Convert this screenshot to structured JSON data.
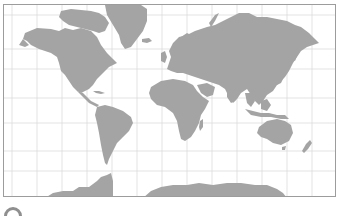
{
  "map": {
    "title": "",
    "projection": "world-cylindrical",
    "colors": {
      "land": "#a4a4a4",
      "ocean": "#ffffff",
      "gridline": "#dcdcdc",
      "border": "#9c9c9c",
      "corner_icon": "#8f8f8f"
    },
    "grid": {
      "meridians_x": [
        11,
        36,
        61,
        86,
        111,
        136,
        161,
        186,
        211,
        236,
        261,
        286,
        311
      ],
      "parallels_y": [
        14,
        48,
        68,
        97,
        122,
        150,
        170
      ]
    },
    "landmasses": [
      "north-america",
      "greenland",
      "south-america",
      "europe",
      "africa",
      "asia",
      "australia",
      "new-zealand",
      "antarctica",
      "madagascar",
      "japan",
      "indonesia",
      "arctic-islands",
      "uk",
      "iceland"
    ]
  },
  "corner_icon": {
    "name": "circle-icon"
  }
}
